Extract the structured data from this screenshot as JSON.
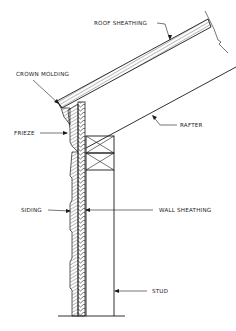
{
  "diagram": {
    "type": "construction cross-section",
    "labels": {
      "roof_sheathing": "ROOF SHEATHING",
      "crown_molding": "CROWN MOLDING",
      "frieze": "FRIEZE",
      "rafter": "RAFTER",
      "siding": "SIDING",
      "wall_sheathing": "WALL SHEATHING",
      "stud": "STUD"
    },
    "colors": {
      "line": "#1a1a1a",
      "background": "#ffffff"
    }
  }
}
